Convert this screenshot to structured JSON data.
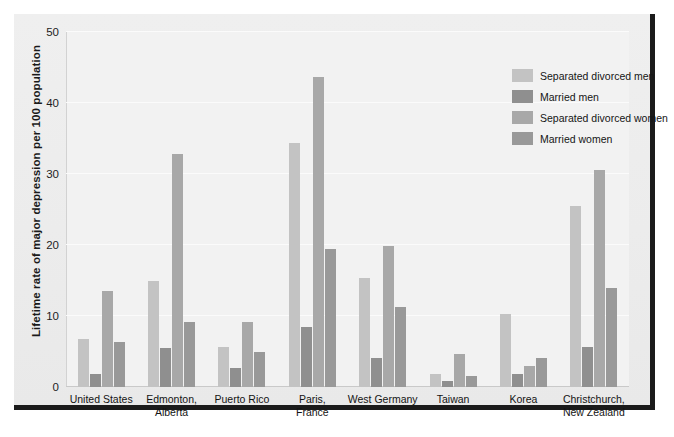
{
  "chart_data": {
    "type": "bar",
    "title": "",
    "subtitle": "",
    "xlabel": "",
    "ylabel": "Lifetime rate of major depression per 100 population",
    "ylim": [
      0,
      50
    ],
    "yticks": [
      0,
      10,
      20,
      30,
      40,
      50
    ],
    "ytick_labels": [
      "0",
      "10",
      "20",
      "30",
      "40",
      "50"
    ],
    "grid": true,
    "legend_position": "top-right",
    "categories": [
      "United States",
      "Edmonton,\nAlberta",
      "Puerto Rico",
      "Paris,\nFrance",
      "West Germany",
      "Taiwan",
      "Korea",
      "Christchurch,\nNew Zealand"
    ],
    "series": [
      {
        "name": "Separated divorced men",
        "color": "#c3c3c3",
        "values": [
          6.8,
          14.9,
          5.6,
          34.3,
          15.3,
          1.9,
          10.3,
          25.5
        ]
      },
      {
        "name": "Married men",
        "color": "#8f8f8f",
        "values": [
          1.9,
          5.5,
          2.7,
          8.4,
          4.1,
          0.9,
          1.9,
          5.6
        ]
      },
      {
        "name": "Separated divorced women",
        "color": "#a8a8a8",
        "values": [
          13.5,
          32.8,
          9.2,
          43.7,
          19.8,
          4.6,
          3.0,
          30.5
        ]
      },
      {
        "name": "Married women",
        "color": "#999999",
        "values": [
          6.4,
          9.1,
          5.0,
          19.4,
          11.3,
          1.6,
          4.1,
          14.0
        ]
      }
    ]
  },
  "figure": {
    "background_color": "#ececec",
    "plot_background_color": "#f2f2f2",
    "frame_rule_color": "#1b1b1b"
  }
}
